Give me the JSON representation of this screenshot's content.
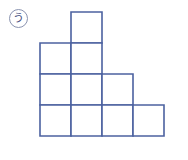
{
  "figure": {
    "label": {
      "text": "う",
      "shape": "circle",
      "icon_name": "circled-letter-badge"
    },
    "colors": {
      "cell_stroke": "#4c62a0",
      "cell_fill": "#ffffff",
      "badge_border": "#8a93b0",
      "badge_text": "#3f4d7e",
      "background": "#ffffff"
    },
    "geometry": {
      "origin_x": 40,
      "origin_y": 12,
      "cell_size": 31,
      "columns": 4,
      "rows": 4
    },
    "rows": [
      {
        "row_index": 0,
        "label": "row-1-top",
        "cell_count": 1,
        "start_column": 1,
        "columns": [
          1
        ]
      },
      {
        "row_index": 1,
        "label": "row-2",
        "cell_count": 2,
        "start_column": 0,
        "columns": [
          0,
          1
        ]
      },
      {
        "row_index": 2,
        "label": "row-3",
        "cell_count": 3,
        "start_column": 0,
        "columns": [
          0,
          1,
          2
        ]
      },
      {
        "row_index": 3,
        "label": "row-4-bottom",
        "cell_count": 4,
        "start_column": 0,
        "columns": [
          0,
          1,
          2,
          3
        ]
      }
    ],
    "total_cells": 10
  }
}
